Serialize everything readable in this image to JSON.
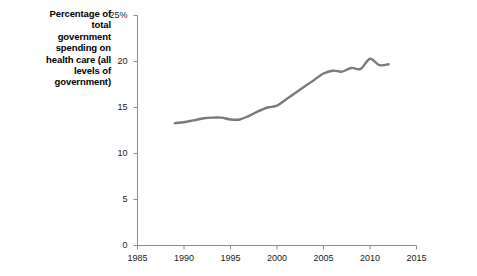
{
  "axis_label": {
    "lines": [
      "Percentage of",
      "total",
      "government",
      "spending on",
      "health care (all",
      "levels of",
      "government)"
    ],
    "text": "Percentage of total government spending on health care (all levels of government)"
  },
  "colors": {
    "line": "#7a7a7a",
    "axis": "#8c8c8c",
    "text": "#000000"
  },
  "chart_data": {
    "type": "line",
    "title": "",
    "xlabel": "",
    "ylabel": "Percentage of total government spending on health care (all levels of government)",
    "xlim": [
      1985,
      2015
    ],
    "ylim": [
      0,
      25
    ],
    "grid": false,
    "legend": "none",
    "xticks": [
      1985,
      1990,
      1995,
      2000,
      2005,
      2010,
      2015
    ],
    "xtick_labels": [
      "1985",
      "1990",
      "1995",
      "2000",
      "2005",
      "2010",
      "2015"
    ],
    "yticks": [
      0,
      5,
      10,
      15,
      20,
      25
    ],
    "ytick_labels": [
      "0",
      "5",
      "10",
      "15",
      "20",
      "25%"
    ],
    "series": [
      {
        "name": "Health care share of government spending",
        "x": [
          1989,
          1990,
          1991,
          1992,
          1993,
          1994,
          1995,
          1996,
          1997,
          1998,
          1999,
          2000,
          2001,
          2002,
          2003,
          2004,
          2005,
          2006,
          2007,
          2008,
          2009,
          2010,
          2011,
          2012
        ],
        "values": [
          13.3,
          13.4,
          13.6,
          13.8,
          13.9,
          13.9,
          13.7,
          13.7,
          14.1,
          14.6,
          15.0,
          15.2,
          15.9,
          16.6,
          17.3,
          18.0,
          18.7,
          19.0,
          18.9,
          19.3,
          19.2,
          20.3,
          19.6,
          19.7
        ]
      }
    ]
  }
}
